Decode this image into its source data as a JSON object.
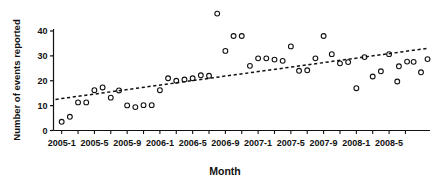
{
  "chart_data": {
    "type": "scatter",
    "title": "",
    "xlabel": "Month",
    "ylabel": "Number of events reported",
    "ylim": [
      0,
      48
    ],
    "yticks": [
      0,
      10,
      20,
      30,
      40
    ],
    "xtick_labels": [
      "2005-1",
      "2005-5",
      "2005-9",
      "2006-1",
      "2006-5",
      "2006-9",
      "2007-1",
      "2007-5",
      "2007-9",
      "2008-1",
      "2008-5"
    ],
    "xtick_months": [
      0,
      4,
      8,
      12,
      16,
      20,
      24,
      28,
      32,
      36,
      40
    ],
    "x_range_months": [
      -1,
      45
    ],
    "grid": false,
    "legend": null,
    "marker": "open-circle",
    "x": [
      "2005-1",
      "2005-2",
      "2005-3",
      "2005-4",
      "2005-5",
      "2005-6",
      "2005-7",
      "2005-8",
      "2005-9",
      "2005-10",
      "2005-11",
      "2005-12",
      "2006-1",
      "2006-2",
      "2006-3",
      "2006-4",
      "2006-5",
      "2006-6",
      "2006-7",
      "2006-8",
      "2006-9",
      "2006-10",
      "2006-11",
      "2006-12",
      "2007-1",
      "2007-2",
      "2007-3",
      "2007-4",
      "2007-5",
      "2007-6",
      "2007-7",
      "2007-8",
      "2007-9",
      "2007-10",
      "2007-11",
      "2007-12",
      "2008-1",
      "2008-2",
      "2008-3",
      "2008-4",
      "2008-5",
      "2008-6"
    ],
    "values": [
      3.5,
      5.5,
      11.3,
      11.3,
      16.2,
      17.3,
      13.2,
      16.1,
      10.1,
      9.4,
      10.2,
      10.2,
      16.2,
      21.0,
      20.0,
      20.5,
      21.0,
      22.2,
      22.0,
      47.0,
      32.0,
      38.0,
      38.0,
      26.0,
      29.0,
      29.0,
      28.5,
      28.0,
      33.8,
      24.0,
      24.2,
      29.0,
      38.0,
      30.7,
      27.0,
      27.5,
      17.0,
      29.5,
      21.7,
      23.8,
      30.7,
      19.7
    ],
    "extra_values": [
      25.8,
      27.7,
      27.6,
      23.4,
      28.7
    ],
    "trendline": {
      "label": "linear trend (dashed)",
      "y_start": 12.5,
      "y_end": 33.0,
      "style": "dotted"
    }
  },
  "axis": {
    "y_title": "Number of events reported",
    "x_title": "Month"
  }
}
